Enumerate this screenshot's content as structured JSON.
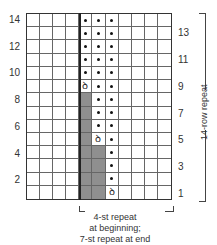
{
  "chart": {
    "columns": 11,
    "rows": 14,
    "colors": {
      "shaded": "#8f8f8f",
      "grid_line": "#666666",
      "dot": "#111111"
    },
    "symbols": {
      "dot": "purl-dot",
      "increase": "ꝺ"
    },
    "left_row_labels": [
      "14",
      "12",
      "10",
      "8",
      "6",
      "4",
      "2"
    ],
    "right_row_labels": [
      "13",
      "11",
      "9",
      "7",
      "5",
      "3",
      "1"
    ],
    "cells": {
      "note": "row 1 is bottom; col 1 is leftmost",
      "col5": {
        "shaded_rows": [
          1,
          2,
          3,
          4,
          5,
          6,
          7,
          8
        ],
        "increase_row": 9,
        "dot_rows": [
          10,
          11,
          12,
          13,
          14
        ]
      },
      "col6": {
        "shaded_rows": [
          1,
          2,
          3,
          4
        ],
        "increase_row": 5,
        "dot_rows": [
          6,
          7,
          8,
          9,
          10,
          11,
          12,
          13,
          14
        ]
      },
      "col7": {
        "shaded_rows": [],
        "increase_row": 1,
        "dot_rows": [
          2,
          3,
          4,
          5,
          6,
          7,
          8,
          9,
          10,
          11,
          12,
          13,
          14
        ]
      }
    }
  },
  "labels": {
    "row_repeat": "14-row repeat",
    "stitch_repeat_line1": "4-st repeat",
    "stitch_repeat_line2": "at beginning;",
    "stitch_repeat_line3": "7-st repeat at end"
  }
}
